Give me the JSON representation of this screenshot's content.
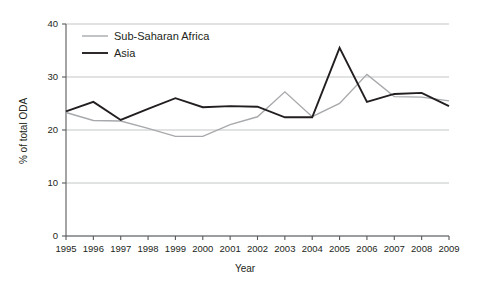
{
  "chart_data": {
    "type": "line",
    "title": "",
    "xlabel": "Year",
    "ylabel": "% of total ODA",
    "categories": [
      "1995",
      "1996",
      "1997",
      "1998",
      "1999",
      "2000",
      "2001",
      "2002",
      "2003",
      "2004",
      "2005",
      "2006",
      "2007",
      "2008",
      "2009"
    ],
    "x": [
      1995,
      1996,
      1997,
      1998,
      1999,
      2000,
      2001,
      2002,
      2003,
      2004,
      2005,
      2006,
      2007,
      2008,
      2009
    ],
    "xlim": [
      1995,
      2009
    ],
    "ylim": [
      0,
      40
    ],
    "yticks": [
      0,
      10,
      20,
      30,
      40
    ],
    "ytick_labels": [
      "0",
      "10",
      "20",
      "30",
      "40"
    ],
    "grid": "horizontal",
    "legend_position": "top-left-inside",
    "series": [
      {
        "name": "Sub-Saharan Africa",
        "color": "#a7a9ac",
        "values": [
          23.3,
          21.8,
          21.7,
          20.3,
          18.8,
          18.8,
          21.0,
          22.5,
          27.2,
          22.5,
          25.0,
          30.5,
          26.3,
          26.2,
          25.5
        ]
      },
      {
        "name": "Asia",
        "color": "#231f20",
        "values": [
          23.5,
          25.3,
          21.9,
          24.0,
          26.0,
          24.3,
          24.5,
          24.4,
          22.4,
          22.4,
          35.5,
          25.3,
          26.8,
          27.0,
          24.5
        ]
      }
    ]
  },
  "axes": {
    "y_title": "% of total ODA",
    "x_title": "Year",
    "y_tick_labels": [
      "40",
      "30",
      "20",
      "10",
      "0"
    ],
    "x_tick_labels": [
      "1995",
      "1996",
      "1997",
      "1998",
      "1999",
      "2000",
      "2001",
      "2002",
      "2003",
      "2004",
      "2005",
      "2006",
      "2007",
      "2008",
      "2009"
    ]
  },
  "legend": {
    "items": [
      {
        "label": "Sub-Saharan Africa",
        "color": "#a7a9ac"
      },
      {
        "label": "Asia",
        "color": "#231f20"
      }
    ]
  },
  "colors": {
    "background": "#ffffff",
    "grid": "#bcbec0",
    "axis": "#58595b",
    "text": "#231f20",
    "series_africa": "#a7a9ac",
    "series_asia": "#231f20"
  }
}
